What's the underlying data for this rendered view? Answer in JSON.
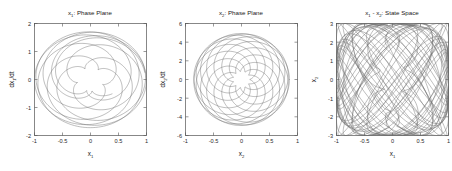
{
  "figure": {
    "background": "#ffffff",
    "curve_color": "#6b6b6b",
    "axis_color": "#555555",
    "width": 452,
    "height": 171
  },
  "panels": [
    {
      "id": "panel-x1-phase-plane",
      "title_main": "x",
      "title_sub": "1",
      "title_rest": ": Phase Plane",
      "title_full": "x₁: Phase Plane",
      "xlabel_main": "x",
      "xlabel_sub": "1",
      "ylabel_full": "dx₁/dt",
      "ylabel_pre": "dx",
      "ylabel_sub": "1",
      "ylabel_post": "/dt",
      "xticks": [
        "-1",
        "-0.5",
        "0",
        "0.5",
        "1"
      ],
      "xtick_values": [
        -1,
        -0.5,
        0,
        0.5,
        1
      ],
      "yticks": [
        "2",
        "1",
        "0",
        "-1",
        "-2"
      ],
      "ytick_values": [
        2,
        1,
        0,
        -1,
        -2
      ],
      "xlim": [
        -1,
        1
      ],
      "ylim": [
        -2,
        2
      ]
    },
    {
      "id": "panel-x2-phase-plane",
      "title_main": "x",
      "title_sub": "2",
      "title_rest": ": Phase Plane",
      "title_full": "x₂: Phase Plane",
      "xlabel_main": "x",
      "xlabel_sub": "2",
      "ylabel_full": "dx₂/dt",
      "ylabel_pre": "dx",
      "ylabel_sub": "2",
      "ylabel_post": "/dt",
      "xticks": [
        "-1",
        "-0.5",
        "0",
        "0.5",
        "1"
      ],
      "xtick_values": [
        -1,
        -0.5,
        0,
        0.5,
        1
      ],
      "yticks": [
        "6",
        "4",
        "2",
        "0",
        "-2",
        "-4",
        "-6"
      ],
      "ytick_values": [
        6,
        4,
        2,
        0,
        -2,
        -4,
        -6
      ],
      "xlim": [
        -1,
        1
      ],
      "ylim": [
        -6,
        6
      ]
    },
    {
      "id": "panel-state-space",
      "title_main": "x",
      "title_sub": "1",
      "title_mid": " - x",
      "title_sub2": "2",
      "title_rest": ": State Space",
      "title_full": "x₁ - x₂: State Space",
      "xlabel_main": "x",
      "xlabel_sub": "1",
      "ylabel_full": "x₂",
      "ylabel_pre": "x",
      "ylabel_sub": "2",
      "ylabel_post": "",
      "xticks": [
        "-1",
        "-0.5",
        "0",
        "0.5",
        "1"
      ],
      "xtick_values": [
        -1,
        -0.5,
        0,
        0.5,
        1
      ],
      "yticks": [
        "3",
        "2",
        "1",
        "0",
        "-1",
        "-2",
        "-3"
      ],
      "ytick_values": [
        3,
        2,
        1,
        0,
        -1,
        -2,
        -3
      ],
      "xlim": [
        -1,
        1
      ],
      "ylim": [
        -3,
        3
      ]
    }
  ],
  "chart_data": [
    {
      "type": "line",
      "title": "x₁: Phase Plane",
      "xlabel": "x₁",
      "ylabel": "dx₁/dt",
      "xlim": [
        -1,
        1
      ],
      "ylim": [
        -2,
        2
      ],
      "grid": false,
      "legend": "none",
      "description": "Quasi-periodic phase-plane trajectory: nested, mutually rotated elliptical loops filling an annulus; outer loops reach radius ~1 in x₁ and ~1.7 in dx₁/dt, inner loops shrink to ~0.25 / ~0.5.",
      "series": [
        {
          "name": "x1 trajectory",
          "generator": "epicycle",
          "params": {
            "a1": 0.62,
            "w1": 1.0,
            "p1": 0.0,
            "a2": 0.38,
            "w2": 1.62,
            "p2": 0.4,
            "y_scale": 1.72,
            "turns": 9,
            "samples": 2400
          }
        }
      ]
    },
    {
      "type": "line",
      "title": "x₂: Phase Plane",
      "xlabel": "x₂",
      "ylabel": "dx₂/dt",
      "xlim": [
        -1,
        1
      ],
      "ylim": [
        -6,
        6
      ],
      "grid": false,
      "legend": "none",
      "description": "Rosette / flower trajectory with about 11 slender petals radiating from origin; petal tips reach x₂ ≈ ±0.85 and dx₂/dt ≈ ±5.2, inner core a small cluster near the origin.",
      "series": [
        {
          "name": "x2 trajectory",
          "generator": "rose",
          "params": {
            "petals": 11,
            "r_outer": 0.93,
            "r_inner": 0.16,
            "x_scale": 0.92,
            "y_scale": 5.3,
            "samples": 3000
          }
        }
      ]
    },
    {
      "type": "line",
      "title": "x₁ - x₂: State Space",
      "xlabel": "x₁",
      "ylabel": "x₂",
      "xlim": [
        -1,
        1
      ],
      "ylim": [
        -3,
        3
      ],
      "grid": false,
      "legend": "none",
      "description": "Lissajous-style state-space torus projection: a diamond / lens-shaped envelope woven from crossing arcs spanning x₁ ∈ [-1, 1] and x₂ ∈ [-3, 3], with a dense lattice of vertical and horizontal arc families.",
      "series": [
        {
          "name": "state space trajectory",
          "generator": "lissajous",
          "params": {
            "wx": 1.0,
            "wy": 5.0,
            "ax": 1.0,
            "ay": 3.0,
            "phase_step": 0.22,
            "loops": 14,
            "samples": 2600
          }
        }
      ]
    }
  ]
}
